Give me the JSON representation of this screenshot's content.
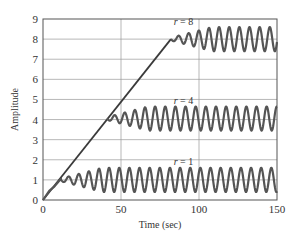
{
  "chart_data": {
    "type": "line",
    "title": "",
    "xlabel": "Time (sec)",
    "ylabel": "Amplitude",
    "xlim": [
      0,
      150
    ],
    "ylim": [
      0,
      9
    ],
    "xticks": [
      0,
      50,
      100,
      150
    ],
    "yticks": [
      0,
      1,
      2,
      3,
      4,
      5,
      6,
      7,
      8,
      9
    ],
    "grid": true,
    "legend": "none",
    "colors": {
      "ramp": "#3a3a3a",
      "response": "#555555",
      "grid": "#9a9a9a",
      "frame": "#555555"
    },
    "ramp": {
      "name": "ramp reference",
      "x": [
        0,
        82
      ],
      "y": [
        0,
        8
      ]
    },
    "series": [
      {
        "name": "r = 1",
        "label_r": "r",
        "label_value": "= 1",
        "label_at": [
          90,
          1.75
        ],
        "join_time": 11.5,
        "level": 1.0,
        "steady_amplitude": 0.6,
        "period": 6.5,
        "points": [
          [
            0,
            0
          ],
          [
            4,
            0.4
          ],
          [
            7,
            0.6
          ],
          [
            11.5,
            1.05
          ],
          [
            14,
            0.95
          ],
          [
            17,
            1.2
          ],
          [
            150,
            1.0
          ]
        ]
      },
      {
        "name": "r = 4",
        "label_r": "r",
        "label_value": "= 4",
        "label_at": [
          90,
          4.75
        ],
        "join_time": 41,
        "level": 4.05,
        "steady_amplitude": 0.6,
        "period": 6.5,
        "points": [
          [
            41,
            4.0
          ],
          [
            150,
            4.05
          ]
        ]
      },
      {
        "name": "r = 8",
        "label_r": "r",
        "label_value": "= 8",
        "label_at": [
          90,
          8.7
        ],
        "join_time": 82,
        "level": 8.0,
        "steady_amplitude": 0.6,
        "period": 6.5,
        "points": [
          [
            82,
            8.0
          ],
          [
            150,
            8.0
          ]
        ]
      }
    ]
  }
}
